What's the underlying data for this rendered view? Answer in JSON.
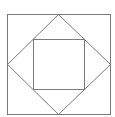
{
  "diagram": {
    "stroke_color": "#7a7a7a",
    "background": "#ffffff",
    "outer_square": {
      "x1": 7,
      "y1": 14,
      "x2": 110,
      "y2": 114
    },
    "diamond": {
      "top": [
        58,
        14
      ],
      "right": [
        110,
        64
      ],
      "bottom": [
        58,
        114
      ],
      "left": [
        7,
        64
      ]
    },
    "inner_square": {
      "x1": 33,
      "y1": 39,
      "x2": 84,
      "y2": 89
    }
  }
}
